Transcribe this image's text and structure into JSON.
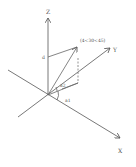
{
  "diagram": {
    "type": "3d-coordinate-system",
    "axes": {
      "z_label": "Z",
      "y_label": "Y",
      "x_label": "X"
    },
    "point_label": "(4<30<45)",
    "distance_label": "d",
    "angle_labels": {
      "a1": "a1",
      "a2": "a2"
    },
    "colors": {
      "line": "#555555",
      "background": "#ffffff"
    }
  }
}
